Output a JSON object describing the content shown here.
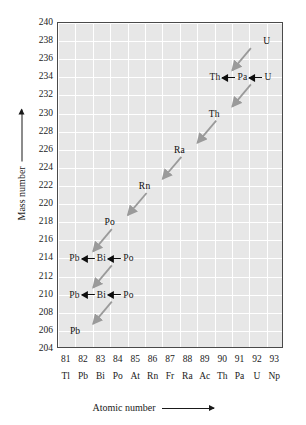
{
  "chart_data": {
    "type": "scatter",
    "title": "",
    "xlabel": "Atomic number",
    "ylabel": "Mass number",
    "xlim": [
      80.5,
      93.5
    ],
    "ylim": [
      204,
      240
    ],
    "grid": true,
    "legend": "none",
    "x_ticks": [
      81,
      82,
      83,
      84,
      85,
      86,
      87,
      88,
      89,
      90,
      91,
      92,
      93
    ],
    "x_tick_symbols": [
      "Tl",
      "Pb",
      "Bi",
      "Po",
      "At",
      "Rn",
      "Fr",
      "Ra",
      "Ac",
      "Th",
      "Pa",
      "U",
      "Np"
    ],
    "y_ticks": [
      204,
      206,
      208,
      210,
      212,
      214,
      216,
      218,
      220,
      222,
      224,
      226,
      228,
      230,
      232,
      234,
      236,
      238,
      240
    ],
    "nuclides": [
      {
        "label": "U",
        "z": 92,
        "a": 238,
        "anchor": "left"
      },
      {
        "label": "Th",
        "z": 90,
        "a": 234,
        "anchor": "right"
      },
      {
        "label": "Pa",
        "z": 91,
        "a": 234,
        "anchor": "center"
      },
      {
        "label": "U",
        "z": 92,
        "a": 234,
        "anchor": "left"
      },
      {
        "label": "Th",
        "z": 90,
        "a": 230,
        "anchor": "right"
      },
      {
        "label": "Ra",
        "z": 88,
        "a": 226,
        "anchor": "right"
      },
      {
        "label": "Rn",
        "z": 86,
        "a": 222,
        "anchor": "right"
      },
      {
        "label": "Po",
        "z": 84,
        "a": 218,
        "anchor": "right"
      },
      {
        "label": "Pb",
        "z": 82,
        "a": 214,
        "anchor": "right"
      },
      {
        "label": "Bi",
        "z": 83,
        "a": 214,
        "anchor": "center"
      },
      {
        "label": "Po",
        "z": 84,
        "a": 214,
        "anchor": "left"
      },
      {
        "label": "Pb",
        "z": 82,
        "a": 210,
        "anchor": "right"
      },
      {
        "label": "Bi",
        "z": 83,
        "a": 210,
        "anchor": "center"
      },
      {
        "label": "Po",
        "z": 84,
        "a": 210,
        "anchor": "left"
      },
      {
        "label": "Pb",
        "z": 82,
        "a": 206,
        "anchor": "right"
      }
    ],
    "alpha_decays": [
      {
        "from_z": 92,
        "from_a": 238,
        "to_z": 90,
        "to_a": 234
      },
      {
        "from_z": 92,
        "from_a": 234,
        "to_z": 90,
        "to_a": 230
      },
      {
        "from_z": 90,
        "from_a": 230,
        "to_z": 88,
        "to_a": 226
      },
      {
        "from_z": 88,
        "from_a": 226,
        "to_z": 86,
        "to_a": 222
      },
      {
        "from_z": 86,
        "from_a": 222,
        "to_z": 84,
        "to_a": 218
      },
      {
        "from_z": 84,
        "from_a": 218,
        "to_z": 82,
        "to_a": 214
      },
      {
        "from_z": 84,
        "from_a": 214,
        "to_z": 82,
        "to_a": 210
      },
      {
        "from_z": 84,
        "from_a": 210,
        "to_z": 82,
        "to_a": 206
      }
    ],
    "beta_chains": [
      {
        "a": 234,
        "items": [
          "Th",
          "Pa",
          "U"
        ]
      },
      {
        "a": 214,
        "items": [
          "Pb",
          "Bi",
          "Po"
        ]
      },
      {
        "a": 210,
        "items": [
          "Pb",
          "Bi",
          "Po"
        ]
      }
    ],
    "colors": {
      "plot_background": "#e7e7e7",
      "gridline": "#ffffff",
      "axis_border": "#4a4a4a",
      "alpha_arrow": "#9a9a9a",
      "text": "#0d0d0d"
    }
  }
}
